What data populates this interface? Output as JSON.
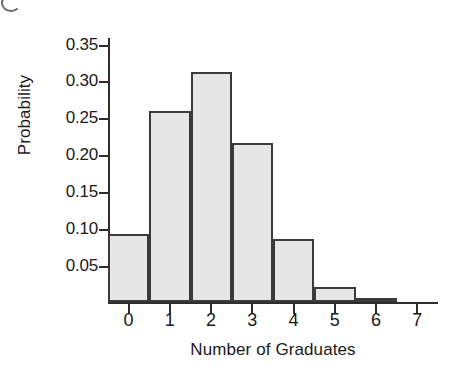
{
  "chart_data": {
    "type": "bar",
    "title": "",
    "xlabel": "Number of Graduates",
    "ylabel": "Probability",
    "categories": [
      "0",
      "1",
      "2",
      "3",
      "4",
      "5",
      "6"
    ],
    "values": [
      0.092,
      0.259,
      0.311,
      0.216,
      0.086,
      0.02,
      0.005
    ],
    "x_tick_labels": [
      "0",
      "1",
      "2",
      "3",
      "4",
      "5",
      "6",
      "7"
    ],
    "y_tick_labels": [
      "0.05",
      "0.10",
      "0.15",
      "0.20",
      "0.25",
      "0.30",
      "0.35"
    ],
    "y_tick_values": [
      0.05,
      0.1,
      0.15,
      0.2,
      0.25,
      0.3,
      0.35
    ],
    "xlim": [
      -0.5,
      7.5
    ],
    "ylim": [
      0,
      0.3575
    ],
    "grid": false,
    "legend": null,
    "bar_fill_color": "#e6e6e6",
    "bar_edge_color": "#3b3b3b",
    "axis_color": "#2e2e2e"
  }
}
